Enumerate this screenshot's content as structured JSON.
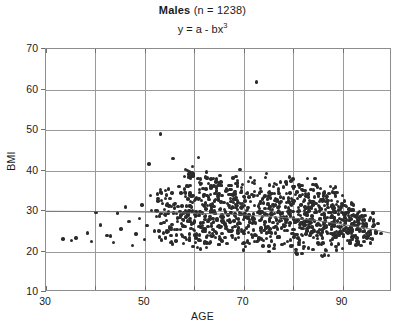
{
  "chart_data": {
    "type": "scatter",
    "title": "Males (n = 1238)",
    "title_bold_part": "Males",
    "title_rest": " (n = 1238)",
    "subtitle": "y = a - bx",
    "subtitle_exponent": "3",
    "xlabel": "AGE",
    "ylabel": "BMI",
    "xlim": [
      30,
      100
    ],
    "ylim": [
      10,
      70
    ],
    "xticks": [
      30,
      40,
      50,
      60,
      70,
      80,
      90,
      100
    ],
    "xtick_labels": [
      "30",
      "50",
      "70",
      "90"
    ],
    "xtick_labeled_values": [
      30,
      50,
      70,
      90
    ],
    "yticks": [
      10,
      20,
      30,
      40,
      50,
      60,
      70
    ],
    "ytick_labels": [
      "10",
      "20",
      "30",
      "40",
      "50",
      "60",
      "70"
    ],
    "grid": true,
    "legend": "none",
    "n": 1238,
    "series": [
      {
        "name": "Males",
        "marker": "filled-circle",
        "color": "#2b2b2b",
        "points": [
          [
            33.4,
            23.1
          ],
          [
            35.2,
            22.7
          ],
          [
            36.1,
            23.3
          ],
          [
            38.4,
            24.6
          ],
          [
            39.2,
            22.4
          ],
          [
            40.1,
            29.6
          ],
          [
            41.0,
            26.5
          ],
          [
            42.3,
            23.9
          ],
          [
            43.1,
            23.8
          ],
          [
            43.6,
            22.2
          ],
          [
            44.5,
            29.5
          ],
          [
            45.2,
            25.6
          ],
          [
            46.1,
            31.0
          ],
          [
            46.8,
            27.4
          ],
          [
            47.5,
            21.5
          ],
          [
            48.2,
            24.3
          ],
          [
            48.9,
            28.1
          ],
          [
            49.4,
            31.5
          ],
          [
            49.9,
            22.9
          ],
          [
            50.4,
            26.4
          ],
          [
            50.8,
            41.6
          ],
          [
            51.1,
            33.9
          ],
          [
            51.4,
            30.2
          ],
          [
            51.9,
            25.1
          ],
          [
            52.3,
            28.6
          ],
          [
            52.6,
            34.2
          ],
          [
            52.9,
            23.4
          ],
          [
            53.2,
            49.0
          ],
          [
            53.6,
            31.8
          ],
          [
            53.9,
            27.1
          ],
          [
            54.2,
            35.0
          ],
          [
            54.5,
            24.8
          ],
          [
            54.8,
            29.9
          ],
          [
            55.1,
            33.1
          ],
          [
            55.4,
            26.0
          ],
          [
            55.7,
            43.0
          ],
          [
            56.0,
            30.7
          ],
          [
            56.3,
            22.6
          ],
          [
            56.6,
            28.3
          ],
          [
            56.9,
            36.0
          ],
          [
            57.2,
            25.4
          ],
          [
            57.5,
            31.2
          ],
          [
            57.8,
            27.8
          ],
          [
            58.1,
            34.6
          ],
          [
            58.4,
            23.0
          ],
          [
            58.7,
            29.2
          ],
          [
            59.0,
            39.6
          ],
          [
            59.2,
            32.4
          ],
          [
            59.4,
            26.8
          ],
          [
            59.6,
            30.0
          ],
          [
            59.8,
            38.9
          ],
          [
            60.0,
            24.1
          ],
          [
            60.2,
            28.8
          ],
          [
            60.4,
            33.4
          ],
          [
            60.6,
            21.0
          ],
          [
            60.8,
            43.2
          ],
          [
            61.0,
            29.4
          ],
          [
            61.2,
            36.8
          ],
          [
            61.4,
            25.9
          ],
          [
            61.6,
            31.6
          ],
          [
            61.8,
            27.2
          ],
          [
            62.0,
            34.0
          ],
          [
            62.2,
            22.3
          ],
          [
            62.4,
            30.5
          ],
          [
            62.6,
            38.1
          ],
          [
            62.8,
            26.2
          ],
          [
            63.0,
            32.9
          ],
          [
            63.2,
            28.0
          ],
          [
            63.4,
            35.7
          ],
          [
            63.6,
            23.7
          ],
          [
            63.8,
            29.8
          ],
          [
            64.0,
            31.1
          ],
          [
            64.2,
            25.0
          ],
          [
            64.4,
            37.2
          ],
          [
            64.6,
            27.6
          ],
          [
            64.8,
            33.6
          ],
          [
            65.0,
            21.8
          ],
          [
            65.2,
            30.3
          ],
          [
            65.4,
            36.3
          ],
          [
            65.6,
            24.5
          ],
          [
            65.8,
            28.5
          ],
          [
            66.0,
            32.1
          ],
          [
            66.2,
            26.7
          ],
          [
            66.4,
            34.9
          ],
          [
            66.6,
            22.0
          ],
          [
            66.8,
            29.0
          ],
          [
            67.0,
            31.4
          ],
          [
            67.2,
            27.3
          ],
          [
            67.4,
            35.3
          ],
          [
            67.6,
            24.0
          ],
          [
            67.8,
            30.9
          ],
          [
            68.0,
            33.0
          ],
          [
            68.2,
            26.1
          ],
          [
            68.4,
            38.5
          ],
          [
            68.6,
            28.2
          ],
          [
            68.8,
            32.6
          ],
          [
            69.0,
            23.5
          ],
          [
            69.2,
            29.7
          ],
          [
            69.4,
            31.9
          ],
          [
            69.6,
            25.5
          ],
          [
            69.8,
            36.5
          ],
          [
            70.0,
            27.9
          ],
          [
            70.2,
            33.3
          ],
          [
            70.4,
            21.3
          ],
          [
            70.6,
            30.1
          ],
          [
            70.8,
            34.4
          ],
          [
            71.0,
            26.3
          ],
          [
            71.2,
            28.9
          ],
          [
            71.4,
            32.3
          ],
          [
            71.6,
            24.2
          ],
          [
            71.8,
            37.0
          ],
          [
            72.0,
            29.3
          ],
          [
            72.2,
            31.3
          ],
          [
            72.4,
            27.0
          ],
          [
            72.6,
            61.9
          ],
          [
            72.8,
            33.8
          ],
          [
            73.0,
            22.8
          ],
          [
            73.2,
            30.6
          ],
          [
            73.4,
            35.5
          ],
          [
            73.6,
            25.8
          ],
          [
            73.8,
            28.7
          ],
          [
            74.0,
            32.0
          ],
          [
            74.2,
            26.6
          ],
          [
            74.4,
            38.3
          ],
          [
            74.6,
            23.2
          ],
          [
            74.8,
            29.1
          ],
          [
            75.0,
            31.7
          ],
          [
            75.2,
            27.5
          ],
          [
            75.4,
            34.1
          ],
          [
            75.6,
            24.7
          ],
          [
            75.8,
            30.4
          ],
          [
            76.0,
            36.1
          ],
          [
            76.2,
            21.6
          ],
          [
            76.4,
            28.4
          ],
          [
            76.6,
            32.8
          ],
          [
            76.8,
            26.9
          ],
          [
            77.0,
            30.8
          ],
          [
            77.2,
            23.6
          ],
          [
            77.4,
            33.5
          ],
          [
            77.6,
            27.7
          ],
          [
            77.8,
            29.5
          ],
          [
            78.0,
            35.9
          ],
          [
            78.2,
            25.2
          ],
          [
            78.4,
            31.0
          ],
          [
            78.6,
            28.6
          ],
          [
            78.8,
            22.5
          ],
          [
            79.0,
            33.2
          ],
          [
            79.2,
            26.4
          ],
          [
            79.4,
            30.2
          ],
          [
            79.6,
            37.4
          ],
          [
            79.8,
            24.4
          ],
          [
            80.0,
            29.9
          ],
          [
            80.2,
            32.5
          ],
          [
            80.4,
            27.1
          ],
          [
            80.6,
            19.8
          ],
          [
            80.8,
            34.7
          ],
          [
            81.0,
            23.3
          ],
          [
            81.2,
            30.0
          ],
          [
            81.4,
            26.0
          ],
          [
            81.6,
            31.5
          ],
          [
            81.8,
            28.1
          ],
          [
            82.0,
            35.1
          ],
          [
            82.2,
            21.2
          ],
          [
            82.4,
            29.3
          ],
          [
            82.6,
            33.7
          ],
          [
            82.8,
            25.7
          ],
          [
            83.0,
            27.4
          ],
          [
            83.2,
            30.7
          ],
          [
            83.4,
            23.9
          ],
          [
            83.6,
            32.2
          ],
          [
            83.8,
            28.8
          ],
          [
            84.0,
            36.6
          ],
          [
            84.2,
            24.9
          ],
          [
            84.4,
            29.6
          ],
          [
            84.6,
            31.8
          ],
          [
            84.8,
            26.5
          ],
          [
            85.0,
            22.1
          ],
          [
            85.2,
            34.3
          ],
          [
            85.4,
            28.0
          ],
          [
            85.6,
            30.5
          ],
          [
            85.8,
            25.3
          ],
          [
            86.0,
            32.7
          ],
          [
            86.2,
            27.2
          ],
          [
            86.4,
            29.0
          ],
          [
            86.6,
            20.4
          ],
          [
            86.8,
            33.1
          ],
          [
            87.0,
            24.6
          ],
          [
            87.2,
            30.9
          ],
          [
            87.4,
            26.8
          ],
          [
            87.6,
            28.4
          ],
          [
            87.8,
            31.2
          ],
          [
            88.0,
            23.1
          ],
          [
            88.2,
            35.6
          ],
          [
            88.4,
            27.6
          ],
          [
            88.6,
            29.8
          ],
          [
            88.8,
            25.0
          ],
          [
            89.0,
            32.4
          ],
          [
            89.2,
            21.9
          ],
          [
            89.4,
            28.2
          ],
          [
            89.6,
            30.3
          ],
          [
            89.8,
            26.2
          ],
          [
            90.0,
            33.9
          ],
          [
            90.2,
            24.2
          ],
          [
            90.4,
            29.4
          ],
          [
            90.6,
            27.0
          ],
          [
            90.8,
            31.1
          ],
          [
            91.0,
            22.7
          ],
          [
            91.2,
            28.9
          ],
          [
            91.4,
            25.6
          ],
          [
            91.6,
            30.1
          ],
          [
            91.8,
            26.7
          ],
          [
            92.0,
            23.4
          ],
          [
            92.2,
            29.2
          ],
          [
            92.4,
            27.3
          ],
          [
            92.6,
            24.0
          ],
          [
            92.8,
            28.5
          ],
          [
            93.0,
            26.1
          ],
          [
            93.2,
            22.2
          ],
          [
            93.4,
            29.9
          ],
          [
            93.6,
            25.4
          ],
          [
            94.0,
            27.8
          ],
          [
            94.4,
            23.8
          ],
          [
            94.8,
            26.3
          ],
          [
            95.2,
            24.8
          ],
          [
            95.6,
            28.3
          ],
          [
            96.0,
            22.9
          ],
          [
            96.6,
            25.1
          ],
          [
            97.2,
            26.9
          ],
          [
            97.8,
            24.4
          ]
        ]
      }
    ],
    "fit_line": {
      "name": "y = a - bx^3",
      "color": "#707070",
      "points": [
        [
          30,
          29.6
        ],
        [
          40,
          29.55
        ],
        [
          50,
          29.4
        ],
        [
          60,
          29.15
        ],
        [
          70,
          28.7
        ],
        [
          80,
          27.9
        ],
        [
          85,
          27.3
        ],
        [
          90,
          26.4
        ],
        [
          95,
          25.4
        ],
        [
          100,
          24.2
        ]
      ]
    }
  }
}
